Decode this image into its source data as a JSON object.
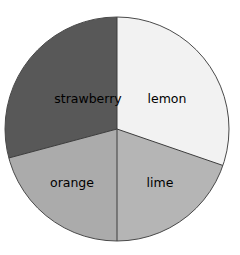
{
  "chart_data": {
    "type": "pie",
    "title": "",
    "subtitle": "",
    "xlabel": "",
    "ylabel": "",
    "grid": false,
    "legend": "none",
    "labels_position": "inside-slice",
    "start_angle_deg": -90,
    "direction": "clockwise",
    "categories": [
      "lemon",
      "lime",
      "orange",
      "strawberry"
    ],
    "values": [
      30.3,
      19.7,
      20.8,
      29.2
    ],
    "units": "percent",
    "slices": [
      {
        "name": "lemon",
        "label": "lemon",
        "value": 30.3,
        "angle_deg": 109,
        "start_deg": -90,
        "end_deg": 19,
        "color": "#F2F2F2",
        "label_x": 167,
        "label_y": 99
      },
      {
        "name": "lime",
        "label": "lime",
        "value": 19.7,
        "angle_deg": 71,
        "start_deg": 19,
        "end_deg": 90,
        "color": "#B5B5B5",
        "label_x": 160,
        "label_y": 183
      },
      {
        "name": "orange",
        "label": "orange",
        "value": 20.8,
        "angle_deg": 75,
        "start_deg": 90,
        "end_deg": 165,
        "color": "#ABABAB",
        "label_x": 72,
        "label_y": 183
      },
      {
        "name": "strawberry",
        "label": "strawberry",
        "value": 29.2,
        "angle_deg": 105,
        "start_deg": 165,
        "end_deg": 270,
        "color": "#585858",
        "label_x": 88,
        "label_y": 99
      }
    ],
    "geometry": {
      "center_x": 117,
      "center_y": 129,
      "radius": 112
    },
    "style": {
      "background": "#FFFFFF",
      "outline_color": "#4A4A4A",
      "outline_width": 1,
      "divider_color": "#3C3C3C",
      "divider_width": 1,
      "label_color": "#000000",
      "label_font_size": 12.5
    }
  }
}
